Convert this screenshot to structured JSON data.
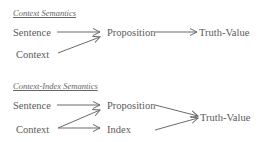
{
  "diagrams": [
    {
      "title": "Context Semantics",
      "nodes": {
        "sentence": "Sentence",
        "context": "Context",
        "proposition": "Proposition",
        "truth_value": "Truth-Value"
      },
      "edges": [
        [
          "Sentence",
          "Proposition"
        ],
        [
          "Context",
          "Proposition"
        ],
        [
          "Proposition",
          "Truth-Value"
        ]
      ]
    },
    {
      "title": "Context-Index Semantics",
      "nodes": {
        "sentence": "Sentence",
        "context": "Context",
        "proposition": "Proposition",
        "index": "Index",
        "truth_value": "Truth-Value"
      },
      "edges": [
        [
          "Sentence",
          "Proposition"
        ],
        [
          "Context",
          "Proposition"
        ],
        [
          "Context",
          "Index"
        ],
        [
          "Proposition",
          "Truth-Value"
        ],
        [
          "Index",
          "Truth-Value"
        ]
      ]
    }
  ],
  "colors": {
    "text": "#5a5a5a",
    "arrow": "#6a6a6a",
    "background": "#ffffff"
  }
}
